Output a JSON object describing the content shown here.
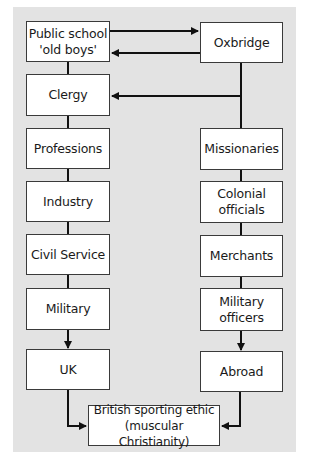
{
  "diagram": {
    "type": "flowchart",
    "background_color": "#e3e3e3",
    "box_fill": "#ffffff",
    "line_color": "#111111",
    "left_column": [
      {
        "id": "public-school",
        "label": "Public school\n'old boys'"
      },
      {
        "id": "clergy",
        "label": "Clergy"
      },
      {
        "id": "professions",
        "label": "Professions"
      },
      {
        "id": "industry",
        "label": "Industry"
      },
      {
        "id": "civil-service",
        "label": "Civil Service"
      },
      {
        "id": "military",
        "label": "Military"
      },
      {
        "id": "uk",
        "label": "UK"
      }
    ],
    "right_column": [
      {
        "id": "oxbridge",
        "label": "Oxbridge"
      },
      {
        "id": "missionaries",
        "label": "Missionaries"
      },
      {
        "id": "colonial-officials",
        "label": "Colonial\nofficials"
      },
      {
        "id": "merchants",
        "label": "Merchants"
      },
      {
        "id": "military-officers",
        "label": "Military\nofficers"
      },
      {
        "id": "abroad",
        "label": "Abroad"
      }
    ],
    "bottom": {
      "id": "british-sporting-ethic",
      "label": "British sporting ethic\n(muscular Christianity)"
    },
    "edges": [
      {
        "from": "public-school",
        "to": "oxbridge",
        "arrow": true
      },
      {
        "from": "oxbridge",
        "to": "public-school",
        "arrow": true
      },
      {
        "from": "oxbridge",
        "to": "clergy",
        "arrow": true
      },
      {
        "from": "public-school",
        "to": "clergy",
        "arrow": false
      },
      {
        "from": "clergy",
        "to": "professions",
        "arrow": false
      },
      {
        "from": "professions",
        "to": "industry",
        "arrow": false
      },
      {
        "from": "industry",
        "to": "civil-service",
        "arrow": false
      },
      {
        "from": "civil-service",
        "to": "military",
        "arrow": false
      },
      {
        "from": "military",
        "to": "uk",
        "arrow": true
      },
      {
        "from": "oxbridge",
        "to": "missionaries",
        "arrow": false
      },
      {
        "from": "missionaries",
        "to": "colonial-officials",
        "arrow": false
      },
      {
        "from": "colonial-officials",
        "to": "merchants",
        "arrow": false
      },
      {
        "from": "merchants",
        "to": "military-officers",
        "arrow": false
      },
      {
        "from": "military-officers",
        "to": "abroad",
        "arrow": true
      },
      {
        "from": "uk",
        "to": "british-sporting-ethic",
        "arrow": true
      },
      {
        "from": "abroad",
        "to": "british-sporting-ethic",
        "arrow": true
      }
    ]
  }
}
